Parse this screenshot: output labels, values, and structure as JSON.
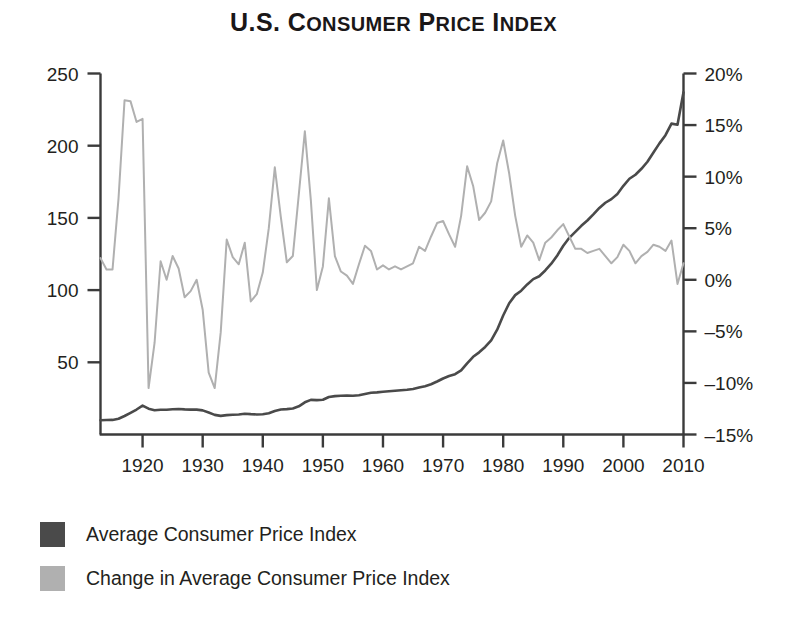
{
  "title": {
    "part1": "U.S. ",
    "c_big": "C",
    "c_small": "ONSUMER",
    "p_big": " P",
    "p_small": "RICE",
    "i_big": " I",
    "i_small": "NDEX",
    "plain": "U.S. CONSUMER PRICE INDEX"
  },
  "legend": {
    "items": [
      {
        "label": "Average Consumer Price Index",
        "color": "#4a4a4a",
        "name": "cpi"
      },
      {
        "label": "Change in Average Consumer Price Index",
        "color": "#b0b0b0",
        "name": "cpi-change"
      }
    ]
  },
  "axes": {
    "left": {
      "ticks": [
        "250",
        "200",
        "150",
        "100",
        "50"
      ],
      "values": [
        250,
        200,
        150,
        100,
        50
      ],
      "min": 0,
      "max": 250
    },
    "right": {
      "ticks": [
        "20%",
        "15%",
        "10%",
        "5%",
        "0%",
        "–5%",
        "–10%",
        "–15%"
      ],
      "values": [
        20,
        15,
        10,
        5,
        0,
        -5,
        -10,
        -15
      ],
      "min": -15,
      "max": 20
    },
    "bottom": {
      "ticks": [
        "1920",
        "1930",
        "1940",
        "1950",
        "1960",
        "1970",
        "1980",
        "1990",
        "2000",
        "2010"
      ],
      "values": [
        1920,
        1930,
        1940,
        1950,
        1960,
        1970,
        1980,
        1990,
        2000,
        2010
      ],
      "min": 1913,
      "max": 2010
    }
  },
  "chart_data": {
    "type": "line",
    "title": "U.S. Consumer Price Index",
    "xlabel": "",
    "ylabel": "Average Consumer Price Index",
    "y2label": "Change in Average Consumer Price Index",
    "xlim": [
      1913,
      2010
    ],
    "ylim": [
      0,
      250
    ],
    "y2lim": [
      -15,
      20
    ],
    "grid": false,
    "legend_position": "below",
    "x": [
      1913,
      1914,
      1915,
      1916,
      1917,
      1918,
      1919,
      1920,
      1921,
      1922,
      1923,
      1924,
      1925,
      1926,
      1927,
      1928,
      1929,
      1930,
      1931,
      1932,
      1933,
      1934,
      1935,
      1936,
      1937,
      1938,
      1939,
      1940,
      1941,
      1942,
      1943,
      1944,
      1945,
      1946,
      1947,
      1948,
      1949,
      1950,
      1951,
      1952,
      1953,
      1954,
      1955,
      1956,
      1957,
      1958,
      1959,
      1960,
      1961,
      1962,
      1963,
      1964,
      1965,
      1966,
      1967,
      1968,
      1969,
      1970,
      1971,
      1972,
      1973,
      1974,
      1975,
      1976,
      1977,
      1978,
      1979,
      1980,
      1981,
      1982,
      1983,
      1984,
      1985,
      1986,
      1987,
      1988,
      1989,
      1990,
      1991,
      1992,
      1993,
      1994,
      1995,
      1996,
      1997,
      1998,
      1999,
      2000,
      2001,
      2002,
      2003,
      2004,
      2005,
      2006,
      2007,
      2008,
      2009,
      2010
    ],
    "series": [
      {
        "name": "Average Consumer Price Index",
        "axis": "left",
        "color": "#4a4a4a",
        "width": 2.6,
        "values": [
          9.9,
          10.0,
          10.1,
          10.9,
          12.8,
          15.0,
          17.3,
          20.0,
          17.9,
          16.8,
          17.1,
          17.1,
          17.5,
          17.7,
          17.4,
          17.2,
          17.2,
          16.7,
          15.2,
          13.6,
          12.9,
          13.4,
          13.7,
          13.9,
          14.4,
          14.1,
          13.9,
          14.0,
          14.7,
          16.3,
          17.3,
          17.6,
          18.0,
          19.5,
          22.3,
          24.0,
          23.8,
          24.1,
          26.0,
          26.6,
          26.8,
          26.9,
          26.8,
          27.2,
          28.1,
          28.9,
          29.2,
          29.6,
          29.9,
          30.3,
          30.6,
          31.0,
          31.5,
          32.5,
          33.4,
          34.8,
          36.7,
          38.8,
          40.5,
          41.8,
          44.4,
          49.3,
          53.8,
          56.9,
          60.6,
          65.2,
          72.6,
          82.4,
          90.9,
          96.5,
          99.6,
          103.9,
          107.6,
          109.6,
          113.6,
          118.3,
          124.0,
          130.7,
          136.2,
          140.3,
          144.5,
          148.2,
          152.4,
          156.9,
          160.5,
          163.0,
          166.6,
          172.2,
          177.1,
          179.9,
          184.0,
          188.9,
          195.3,
          201.6,
          207.3,
          215.3,
          214.5,
          237.0
        ]
      },
      {
        "name": "Change in Average Consumer Price Index",
        "axis": "right",
        "color": "#b0b0b0",
        "width": 2.0,
        "values": [
          2.1,
          1.0,
          1.0,
          7.9,
          17.4,
          17.3,
          15.3,
          15.6,
          -10.5,
          -6.1,
          1.8,
          0.0,
          2.3,
          1.1,
          -1.7,
          -1.1,
          0.0,
          -2.9,
          -9.0,
          -10.5,
          -5.1,
          3.9,
          2.2,
          1.5,
          3.6,
          -2.1,
          -1.4,
          0.7,
          5.0,
          10.9,
          6.1,
          1.7,
          2.3,
          8.3,
          14.4,
          7.7,
          -1.0,
          1.3,
          7.9,
          2.3,
          0.8,
          0.4,
          -0.4,
          1.5,
          3.3,
          2.8,
          1.0,
          1.4,
          1.0,
          1.3,
          1.0,
          1.3,
          1.6,
          3.2,
          2.8,
          4.2,
          5.5,
          5.7,
          4.4,
          3.2,
          6.2,
          11.0,
          9.1,
          5.8,
          6.5,
          7.6,
          11.3,
          13.5,
          10.3,
          6.2,
          3.2,
          4.3,
          3.6,
          1.9,
          3.6,
          4.1,
          4.8,
          5.4,
          4.2,
          3.0,
          3.0,
          2.6,
          2.8,
          3.0,
          2.3,
          1.6,
          2.2,
          3.4,
          2.8,
          1.6,
          2.3,
          2.7,
          3.4,
          3.2,
          2.8,
          3.8,
          -0.4,
          1.6
        ]
      }
    ]
  }
}
